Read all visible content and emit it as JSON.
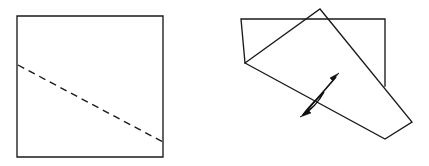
{
  "figure": {
    "caption": "",
    "panel_count": 2,
    "background_color": "#ffffff",
    "line_color": "#1a1a1a",
    "arrow_color": "#111111"
  },
  "panels": [
    {
      "id": "before-fold",
      "label": "",
      "description": "Square sheet with dashed diagonal crease line",
      "shapes": [
        {
          "name": "square-outline",
          "type": "polygon",
          "style": "solid",
          "points": "17,16 163,16 163,157 17,157"
        },
        {
          "name": "crease-line",
          "type": "line",
          "style": "dashed",
          "points": "18,65 163,142"
        }
      ]
    },
    {
      "id": "after-fold",
      "label": "",
      "description": "Folded sheet: original rectangle outline with rotated folded flap overlapping, plus double-headed fold arrow",
      "shapes": [
        {
          "name": "rectangle-outline",
          "type": "polyline",
          "style": "solid",
          "points": "245,63 241,19 385,19 385,86"
        },
        {
          "name": "folded-flap",
          "type": "polygon",
          "style": "solid",
          "points": "245,63 320,9 412,122 385,139"
        },
        {
          "name": "fold-arrow",
          "type": "double-arrow",
          "style": "solid",
          "from": "300,117",
          "to": "339,73"
        }
      ]
    }
  ],
  "geometry": {
    "left_square": {
      "top_left": "17,16",
      "top_right": "163,16",
      "bottom_right": "163,157",
      "bottom_left": "17,157",
      "width": 146,
      "height": 141
    },
    "left_dashed_crease": {
      "start": "18,65",
      "end": "163,142",
      "dash_pattern": "7 5"
    },
    "right_rectangle": {
      "top_left": "241,19",
      "top_right": "385,19",
      "left_bottom": "245,63",
      "right_bottom": "385,86"
    },
    "right_flap": {
      "left_vertex": "245,63",
      "apex": "320,9",
      "right_vertex": "412,122",
      "bottom_vertex": "385,139"
    },
    "fold_arrow": {
      "tail_tip": "300,117",
      "head_tip": "339,73",
      "heads": 2
    }
  }
}
